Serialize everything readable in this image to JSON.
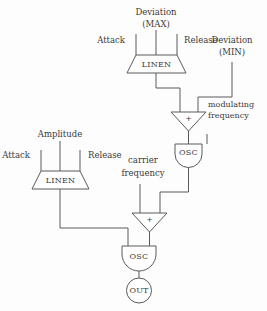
{
  "diagram": {
    "stroke_color": "#5a5a5a",
    "text_color": "#3a3a3a",
    "background_color": "#fdfdfd",
    "modulator_section": {
      "envelope_block_label": "LINEN",
      "inputs": [
        {
          "id": "attack",
          "label": "Attack"
        },
        {
          "id": "deviation-max",
          "label": "Deviation",
          "label2": "(MAX)"
        },
        {
          "id": "release",
          "label": "Release"
        }
      ],
      "side_input": {
        "id": "deviation-min",
        "label": "Deviation",
        "label2": "(MIN)"
      },
      "mixer_label": "+",
      "oscillator_label": "OSC",
      "output_label": "modulating",
      "output_label2": "frequency"
    },
    "carrier_section": {
      "envelope_block_label": "LINEN",
      "inputs": [
        {
          "id": "attack",
          "label": "Attack"
        },
        {
          "id": "amplitude",
          "label": "Amplitude"
        },
        {
          "id": "release",
          "label": "Release"
        }
      ],
      "side_input": {
        "id": "carrier-frequency",
        "label": "carrier",
        "label2": "frequency"
      },
      "mixer_label": "+",
      "oscillator_label": "OSC",
      "output_block_label": "OUT"
    }
  }
}
